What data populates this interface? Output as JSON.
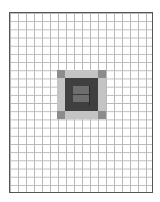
{
  "diagram": {
    "title": "",
    "grid": {
      "columns": 18,
      "rows": 22,
      "line_color": "#b8b8b8",
      "border_color": "#555555"
    },
    "pattern": {
      "description": "Concentric square pattern centered on grid",
      "corner_color": "#8c8c8c",
      "edge_color": "#c4c4c4",
      "inner_color": "#3f3f3f",
      "core_color": "#6e6e6e",
      "core_line_color": "#3a3a3a"
    }
  }
}
